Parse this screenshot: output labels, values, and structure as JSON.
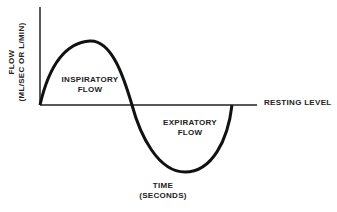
{
  "diagram": {
    "y_axis_label_line1": "FLOW",
    "y_axis_label_line2": "(ML/SEC OR L/MIN)",
    "x_axis_label_line1": "TIME",
    "x_axis_label_line2": "(SECONDS)",
    "inspiratory_line1": "INSPIRATORY",
    "inspiratory_line2": "FLOW",
    "expiratory_line1": "EXPIRATORY",
    "expiratory_line2": "FLOW",
    "baseline_label": "RESTING LEVEL",
    "stroke_color": "#111111"
  }
}
